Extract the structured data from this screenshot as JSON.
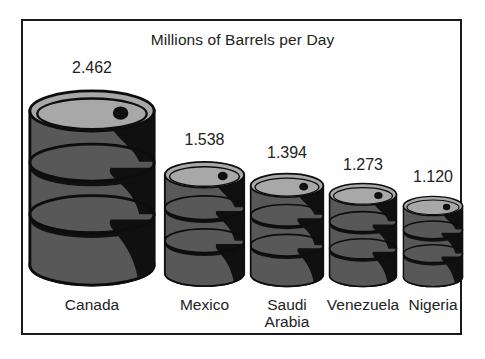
{
  "chart_data": {
    "type": "bar",
    "title": "Millions of Barrels per Day",
    "subtitle": "",
    "xlabel": "",
    "ylabel": "",
    "categories": [
      "Canada",
      "Mexico",
      "Saudi\nArabia",
      "Venezuela",
      "Nigeria"
    ],
    "values": [
      2.462,
      1.538,
      1.394,
      1.273,
      1.12
    ],
    "value_labels": [
      "2.462",
      "1.538",
      "1.394",
      "1.273",
      "1.120"
    ],
    "unit": "millions of barrels per day",
    "grid": false,
    "legend": null,
    "ylim": [
      0,
      2.462
    ],
    "pictorial_glyph": "oil-barrel",
    "note": "Pictorial bar chart: each category drawn as an oil barrel scaled to its value; all barrels share a common baseline."
  },
  "chart": {
    "title": "Millions of Barrels per Day",
    "frame_color": "#1a1a1a",
    "background": "#ffffff",
    "text_color": "#222222"
  },
  "barrel_style": {
    "lid_color": "#a8a8a8",
    "body_color": "#585858",
    "shadow_color": "#101010",
    "outline_color": "#0d0d0d",
    "bung_color": "#101010"
  },
  "bars": [
    {
      "id": "canada",
      "category": "Canada",
      "value_label": "2.462",
      "value": 2.462,
      "left": 27,
      "width": 130,
      "height": 200,
      "label_top": 59,
      "cat_top": 296
    },
    {
      "id": "mexico",
      "category": "Mexico",
      "value_label": "1.538",
      "value": 1.538,
      "left": 163,
      "width": 83,
      "height": 128,
      "label_top": 131,
      "cat_top": 296
    },
    {
      "id": "saudi-arabia",
      "category": "Saudi\nArabia",
      "value_label": "1.394",
      "value": 1.394,
      "left": 249,
      "width": 76,
      "height": 116,
      "label_top": 144,
      "cat_top": 296
    },
    {
      "id": "venezuela",
      "category": "Venezuela",
      "value_label": "1.273",
      "value": 1.273,
      "left": 328,
      "width": 70,
      "height": 106,
      "label_top": 156,
      "cat_top": 296
    },
    {
      "id": "nigeria",
      "category": "Nigeria",
      "value_label": "1.120",
      "value": 1.12,
      "left": 402,
      "width": 62,
      "height": 93,
      "label_top": 168,
      "cat_top": 296
    }
  ]
}
